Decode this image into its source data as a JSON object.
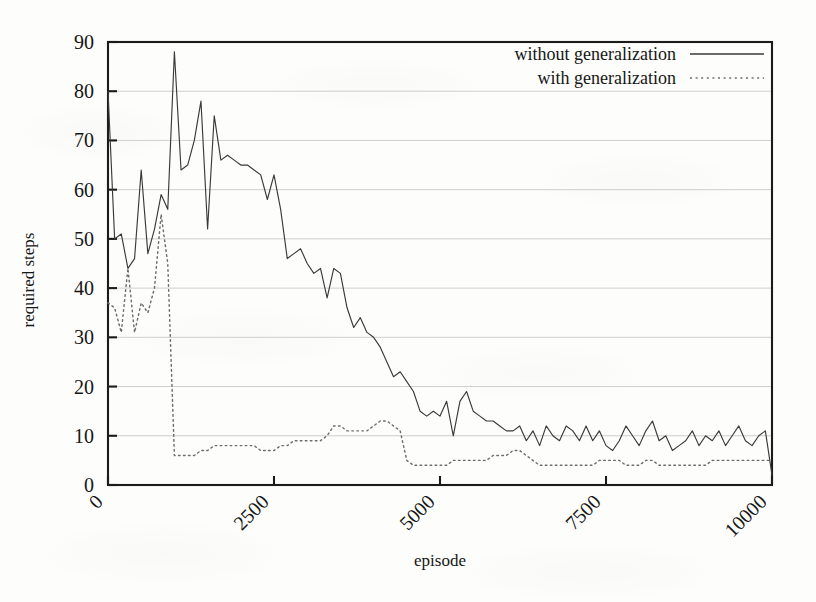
{
  "chart_data": {
    "type": "line",
    "title": "",
    "xlabel": "episode",
    "ylabel": "required steps",
    "xlim": [
      0,
      10000
    ],
    "ylim": [
      0,
      90
    ],
    "xticks": [
      0,
      2500,
      5000,
      7500,
      10000
    ],
    "xtick_labels": [
      "0",
      "2500",
      "5000",
      "7500",
      "10000"
    ],
    "yticks": [
      0,
      10,
      20,
      30,
      40,
      50,
      60,
      70,
      80,
      90
    ],
    "ytick_labels": [
      "0",
      "10",
      "20",
      "30",
      "40",
      "50",
      "60",
      "70",
      "80",
      "90"
    ],
    "grid": true,
    "grid_axis": "y",
    "legend_position": "top-right",
    "legend_border": false,
    "xtick_label_rotation": 45,
    "series": [
      {
        "name": "without generalization",
        "style": "solid",
        "color": "#3a3a3a",
        "x": [
          0,
          100,
          200,
          300,
          400,
          500,
          600,
          700,
          800,
          900,
          1000,
          1100,
          1200,
          1300,
          1400,
          1500,
          1600,
          1700,
          1800,
          1900,
          2000,
          2100,
          2200,
          2300,
          2400,
          2500,
          2600,
          2700,
          2800,
          2900,
          3000,
          3100,
          3200,
          3300,
          3400,
          3500,
          3600,
          3700,
          3800,
          3900,
          4000,
          4100,
          4200,
          4300,
          4400,
          4500,
          4600,
          4700,
          4800,
          4900,
          5000,
          5100,
          5200,
          5300,
          5400,
          5500,
          5600,
          5700,
          5800,
          5900,
          6000,
          6100,
          6200,
          6300,
          6400,
          6500,
          6600,
          6700,
          6800,
          6900,
          7000,
          7100,
          7200,
          7300,
          7400,
          7500,
          7600,
          7700,
          7800,
          7900,
          8000,
          8100,
          8200,
          8300,
          8400,
          8500,
          8600,
          8700,
          8800,
          8900,
          9000,
          9100,
          9200,
          9300,
          9400,
          9500,
          9600,
          9700,
          9800,
          9900,
          10000
        ],
        "y": [
          80,
          50,
          51,
          44,
          46,
          64,
          47,
          52,
          59,
          56,
          88,
          64,
          65,
          70,
          78,
          52,
          75,
          66,
          67,
          66,
          65,
          65,
          64,
          63,
          58,
          63,
          56,
          46,
          47,
          48,
          45,
          43,
          44,
          38,
          44,
          43,
          36,
          32,
          34,
          31,
          30,
          28,
          25,
          22,
          23,
          21,
          19,
          15,
          14,
          15,
          14,
          17,
          10,
          17,
          19,
          15,
          14,
          13,
          13,
          12,
          11,
          11,
          12,
          9,
          11,
          8,
          12,
          10,
          9,
          12,
          11,
          9,
          12,
          9,
          11,
          8,
          7,
          9,
          12,
          10,
          8,
          11,
          13,
          9,
          10,
          7,
          8,
          9,
          11,
          8,
          10,
          9,
          11,
          8,
          10,
          12,
          9,
          8,
          10,
          11,
          2
        ]
      },
      {
        "name": "with generalization",
        "style": "dotted",
        "color": "#6d6d6d",
        "x": [
          0,
          100,
          200,
          300,
          400,
          500,
          600,
          700,
          800,
          900,
          1000,
          1100,
          1200,
          1300,
          1400,
          1500,
          1600,
          1700,
          1800,
          1900,
          2000,
          2100,
          2200,
          2300,
          2400,
          2500,
          2600,
          2700,
          2800,
          2900,
          3000,
          3100,
          3200,
          3300,
          3400,
          3500,
          3600,
          3700,
          3800,
          3900,
          4000,
          4100,
          4200,
          4300,
          4400,
          4500,
          4600,
          4700,
          4800,
          4900,
          5000,
          5100,
          5200,
          5300,
          5400,
          5500,
          5600,
          5700,
          5800,
          5900,
          6000,
          6100,
          6200,
          6300,
          6400,
          6500,
          6600,
          6700,
          6800,
          6900,
          7000,
          7100,
          7200,
          7300,
          7400,
          7500,
          7600,
          7700,
          7800,
          7900,
          8000,
          8100,
          8200,
          8300,
          8400,
          8500,
          8600,
          8700,
          8800,
          8900,
          9000,
          9100,
          9200,
          9300,
          9400,
          9500,
          9600,
          9700,
          9800,
          9900,
          10000
        ],
        "y": [
          37,
          36,
          31,
          44,
          31,
          37,
          35,
          40,
          55,
          45,
          6,
          6,
          6,
          6,
          7,
          7,
          8,
          8,
          8,
          8,
          8,
          8,
          8,
          7,
          7,
          7,
          8,
          8,
          9,
          9,
          9,
          9,
          9,
          10,
          12,
          12,
          11,
          11,
          11,
          11,
          12,
          13,
          13,
          12,
          11,
          5,
          4,
          4,
          4,
          4,
          4,
          4,
          5,
          5,
          5,
          5,
          5,
          5,
          6,
          6,
          6,
          7,
          7,
          6,
          5,
          4,
          4,
          4,
          4,
          4,
          4,
          4,
          4,
          4,
          5,
          5,
          5,
          5,
          4,
          4,
          4,
          5,
          5,
          4,
          4,
          4,
          4,
          4,
          4,
          4,
          4,
          5,
          5,
          5,
          5,
          5,
          5,
          5,
          5,
          5,
          5
        ]
      }
    ]
  },
  "legend": {
    "entries": [
      {
        "label": "without generalization",
        "style": "solid"
      },
      {
        "label": "with generalization",
        "style": "dotted"
      }
    ]
  },
  "axes": {
    "x_title": "episode",
    "y_title": "required steps"
  },
  "colors": {
    "series_solid": "#3a3a3a",
    "series_dotted": "#6d6d6d",
    "grid": "#c9c9cc",
    "frame": "#1b1b1b",
    "background": "#fdfdfb"
  }
}
